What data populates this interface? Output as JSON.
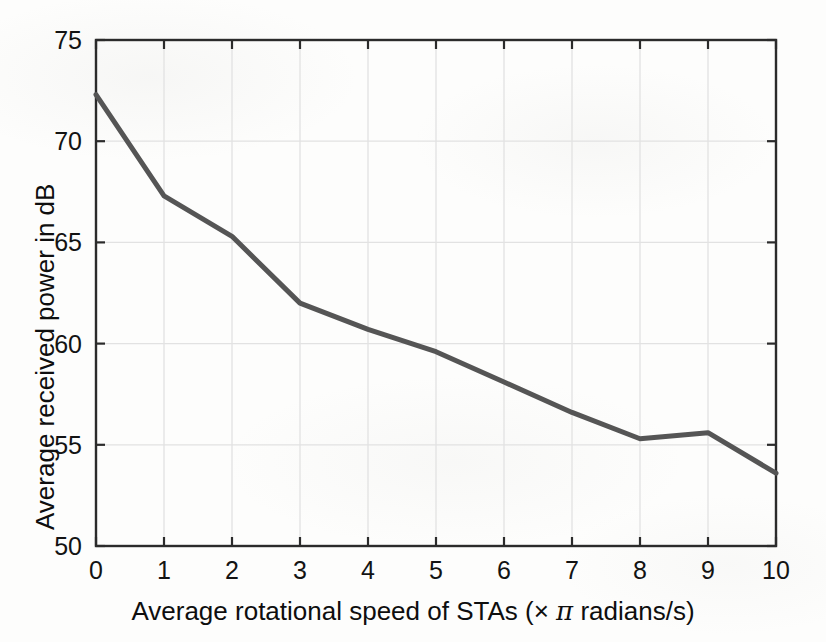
{
  "chart_data": {
    "type": "line",
    "title": "",
    "xlabel": "Average rotational speed of STAs (× π radians/s)",
    "ylabel": "Average received power in dB",
    "xlim": [
      0,
      10
    ],
    "ylim": [
      50,
      75
    ],
    "xticks": [
      "0",
      "1",
      "2",
      "3",
      "4",
      "5",
      "6",
      "7",
      "8",
      "9",
      "10"
    ],
    "yticks": [
      "50",
      "55",
      "60",
      "65",
      "70",
      "75"
    ],
    "grid": true,
    "legend": null,
    "x": [
      0,
      1,
      2,
      3,
      4,
      5,
      6,
      7,
      8,
      9,
      10
    ],
    "series": [
      {
        "name": "Average received power",
        "color": "#555555",
        "values": [
          72.3,
          67.3,
          65.3,
          62.0,
          60.7,
          59.6,
          58.1,
          56.6,
          55.3,
          55.6,
          53.6
        ]
      }
    ],
    "annotations": []
  },
  "axes": {
    "x_title_parts": {
      "prefix": "Average rotational speed of STAs (× ",
      "pi": "π",
      "suffix": " radians/s)"
    },
    "y_title": "Average received power in dB"
  },
  "style": {
    "line_color": "#555555",
    "axis_color": "#2b2b2b",
    "grid_color": "#e2e2e2",
    "background": "#fdfdfc",
    "line_width": 5
  }
}
